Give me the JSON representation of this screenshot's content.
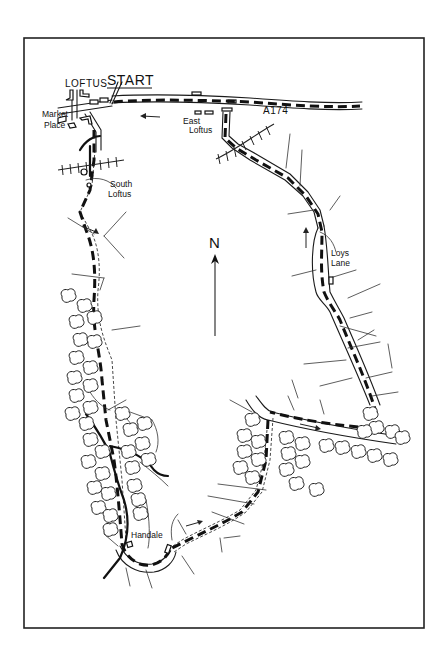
{
  "map": {
    "type": "hand-drawn walking route map",
    "frame": {
      "x": 24,
      "y": 38,
      "width": 400,
      "height": 590
    },
    "labels": {
      "start": "START",
      "loftus": "LOFTUS",
      "market_place_line1": "Market",
      "market_place_line2": "Place",
      "east_loftus_line1": "East",
      "east_loftus_line2": "Loftus",
      "south_loftus_line1": "South",
      "south_loftus_line2": "Loftus",
      "road_a174": "A174",
      "loys_lane_line1": "Loys",
      "loys_lane_line2": "Lane",
      "handale": "Handale",
      "north": "N"
    },
    "legend_symbols": {
      "route": "bold dashed line",
      "direction": "arrow",
      "woodland": "tree-outline",
      "railway": "hatched line",
      "north_arrow": "north-arrow-icon"
    },
    "colors": {
      "ink": "#111111",
      "paper": "#ffffff"
    }
  }
}
